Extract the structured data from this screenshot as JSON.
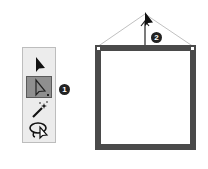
{
  "toolbar": {
    "tools": [
      {
        "name": "selection-tool",
        "icon": "black-arrow-icon",
        "active": false
      },
      {
        "name": "direct-selection-tool",
        "icon": "white-arrow-icon",
        "active": true
      },
      {
        "name": "magic-wand-tool",
        "icon": "magic-wand-icon",
        "active": false
      },
      {
        "name": "lasso-tool",
        "icon": "lasso-icon",
        "active": false
      }
    ]
  },
  "callouts": {
    "one": "1",
    "two": "2"
  },
  "canvas": {
    "frame_color": "#4a4a4a",
    "guide_color": "#b0b0b0"
  }
}
